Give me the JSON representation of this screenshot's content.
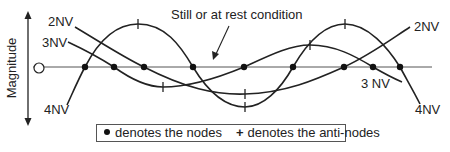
{
  "diagram": {
    "axis_label": "Magnitude",
    "annotation": "Still or at rest condition",
    "curve_labels": {
      "two_nv_left": "2NV",
      "three_nv_left": "3NV",
      "four_nv_left": "4NV",
      "two_nv_right": "2NV",
      "three_nv_right": "3 NV",
      "four_nv_right": "4NV"
    },
    "curves": [
      {
        "name": "2NV",
        "nodes_x": [
          144,
          344
        ],
        "antinodes": [
          [
            245,
            94
          ]
        ]
      },
      {
        "name": "3NV",
        "nodes_x": [
          114,
          244,
          373
        ],
        "antinodes": [
          [
            163,
            87
          ],
          [
            310,
            45
          ]
        ]
      },
      {
        "name": "4NV",
        "nodes_x": [
          85,
          193,
          293,
          400
        ],
        "antinodes": [
          [
            138,
            24
          ],
          [
            245,
            107
          ],
          [
            345,
            24
          ]
        ]
      }
    ],
    "colors": {
      "stroke": "#222222",
      "background": "#ffffff"
    }
  },
  "legend": {
    "nodes_text": "denotes the nodes",
    "antinodes_symbol": "+",
    "antinodes_text": "denotes the anti-nodes"
  }
}
